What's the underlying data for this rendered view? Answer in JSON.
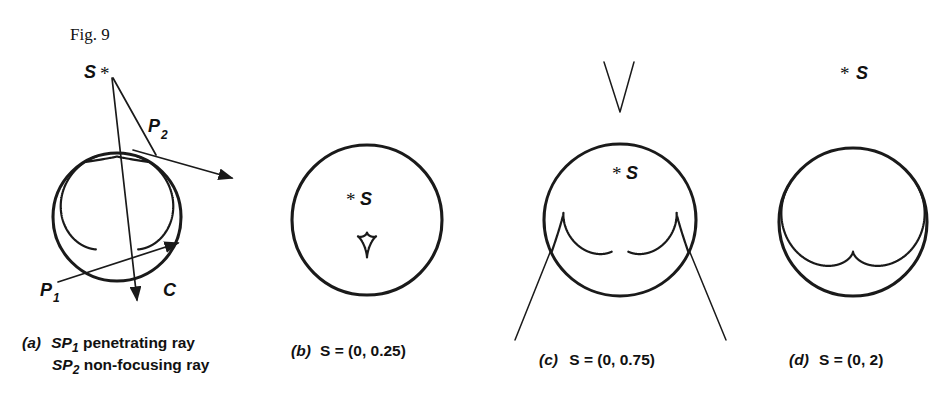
{
  "figure": {
    "title": "Fig. 9",
    "ink_color": "#1a1a1a",
    "background_color": "#ffffff"
  },
  "panels": [
    {
      "id": "a",
      "caption_letter": "(a)",
      "caption_lines": [
        {
          "sym": "SP",
          "sub": "1",
          "text": " penetrating ray"
        },
        {
          "sym": "SP",
          "sub": "2",
          "text": " non-focusing ray"
        }
      ],
      "caption_plain": "(a) SP1 penetrating ray / SP2 non-focusing ray",
      "circle": {
        "cx": 117,
        "cy": 217,
        "r": 64
      },
      "source": {
        "label": "S",
        "marker": "*",
        "x": 112,
        "y": 72,
        "inside": false
      },
      "points": [
        {
          "label": "P",
          "sub": "1",
          "x": 58,
          "y": 289
        },
        {
          "label": "P",
          "sub": "2",
          "x": 157,
          "y": 133
        },
        {
          "label": "C",
          "sub": "",
          "x": 170,
          "y": 289
        }
      ],
      "rays": [
        {
          "name": "penetrating-ray-SP1",
          "arrow": true
        },
        {
          "name": "reflected-ray-P1",
          "arrow": true
        },
        {
          "name": "non-focusing-ray-SP2",
          "arrow": true
        }
      ],
      "caustic": {
        "type": "cardioid-cusp",
        "source_distance": 1.0,
        "cusps": 1
      }
    },
    {
      "id": "b",
      "caption_letter": "(b)",
      "caption_text": "S = (0, 0.25)",
      "source_coords": [
        0,
        0.25
      ],
      "circle": {
        "cx": 367,
        "cy": 220,
        "r": 75
      },
      "source": {
        "label": "S",
        "marker": "*",
        "x": 367,
        "y": 199,
        "inside": true
      },
      "caustic": {
        "type": "small-astroid",
        "source_distance": 0.25,
        "cusps": 4
      }
    },
    {
      "id": "c",
      "caption_letter": "(c)",
      "caption_text": "S = (0, 0.75)",
      "source_coords": [
        0,
        0.75
      ],
      "circle": {
        "cx": 620,
        "cy": 220,
        "r": 76
      },
      "source": {
        "label": "S",
        "marker": "*",
        "x": 627,
        "y": 168,
        "inside": true
      },
      "caustic": {
        "type": "cusped-with-external-branches",
        "source_distance": 0.75,
        "cusps": 3
      },
      "external_cusp_v": {
        "apex_x": 620,
        "apex_y": 108,
        "top_y": 60
      }
    },
    {
      "id": "d",
      "caption_letter": "(d)",
      "caption_text": "S = (0, 2)",
      "source_coords": [
        0,
        2
      ],
      "circle": {
        "cx": 853,
        "cy": 222,
        "r": 74
      },
      "source": {
        "label": "S",
        "marker": "*",
        "x": 860,
        "y": 72,
        "inside": false
      },
      "caustic": {
        "type": "nephroid-like",
        "source_distance": 2.0,
        "cusps": 2
      }
    }
  ],
  "labels": {
    "star_glyph": "*",
    "source_letter": "S",
    "equals": "="
  },
  "chart_data": {
    "type": "diagram",
    "title": "Fig. 9",
    "series": [
      {
        "name": "panel-a",
        "source_position": "on circle / grazing",
        "caustic_cusps": 1
      },
      {
        "name": "panel-b",
        "source_position": "(0, 0.25)",
        "caustic_cusps": 4
      },
      {
        "name": "panel-c",
        "source_position": "(0, 0.75)",
        "caustic_cusps": 3
      },
      {
        "name": "panel-d",
        "source_position": "(0, 2)",
        "caustic_cusps": 2
      }
    ]
  }
}
